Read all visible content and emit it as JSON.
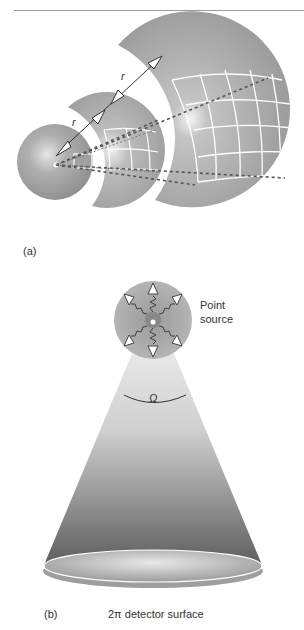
{
  "figure": {
    "panel_a": {
      "label": "(a)",
      "distance_label_1": "r",
      "distance_label_2": "r"
    },
    "panel_b": {
      "label": "(b)",
      "source_label_line1": "Point",
      "source_label_line2": "source",
      "solid_angle_label": "Ω",
      "detector_label": "2π detector surface"
    }
  },
  "colors": {
    "sphere_gray": "#9a9a9a",
    "shell_gray": "#a8a8a8",
    "grid_white": "#ffffff",
    "cone_light": "#ececec",
    "cone_dark": "#6a6a6a",
    "text": "#333333"
  }
}
